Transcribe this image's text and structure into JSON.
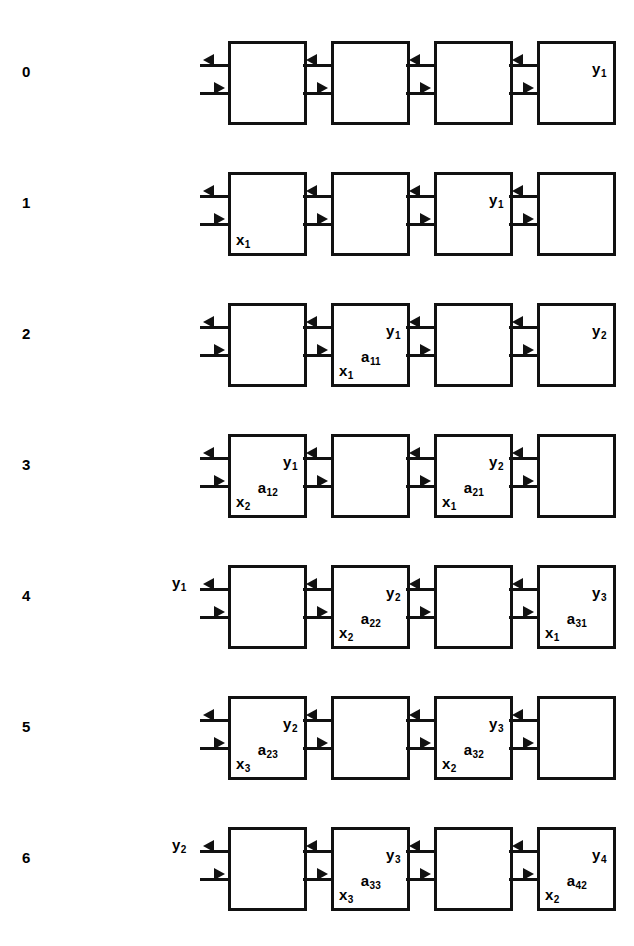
{
  "figure": {
    "type": "systolic-array-timestep-diagram",
    "num_steps": 7,
    "cells_per_row": 4,
    "geometry": {
      "row_pitch": 131,
      "first_row_top": 28,
      "cell_width": 79,
      "cell_height": 84,
      "cell_gap": 24,
      "first_cell_left": 228,
      "wire_stub_length": 28,
      "top_wire_y": 36,
      "bottom_wire_y": 64
    },
    "arrow_directions": {
      "top": "left",
      "bottom": "right"
    }
  },
  "rows": [
    {
      "step": "0",
      "external_left_label": "",
      "cells": [
        {
          "y": "",
          "a": "",
          "x": ""
        },
        {
          "y": "",
          "a": "",
          "x": ""
        },
        {
          "y": "",
          "a": "",
          "x": ""
        },
        {
          "y": "y1",
          "a": "",
          "x": ""
        }
      ]
    },
    {
      "step": "1",
      "external_left_label": "",
      "cells": [
        {
          "y": "",
          "a": "",
          "x": "x1"
        },
        {
          "y": "",
          "a": "",
          "x": ""
        },
        {
          "y": "y1",
          "a": "",
          "x": ""
        },
        {
          "y": "",
          "a": "",
          "x": ""
        }
      ]
    },
    {
      "step": "2",
      "external_left_label": "",
      "cells": [
        {
          "y": "",
          "a": "",
          "x": ""
        },
        {
          "y": "y1",
          "a": "a11",
          "x": "x1"
        },
        {
          "y": "",
          "a": "",
          "x": ""
        },
        {
          "y": "y2",
          "a": "",
          "x": ""
        }
      ]
    },
    {
      "step": "3",
      "external_left_label": "",
      "cells": [
        {
          "y": "y1",
          "a": "a12",
          "x": "x2"
        },
        {
          "y": "",
          "a": "",
          "x": ""
        },
        {
          "y": "y2",
          "a": "a21",
          "x": "x1"
        },
        {
          "y": "",
          "a": "",
          "x": ""
        }
      ]
    },
    {
      "step": "4",
      "external_left_label": "y1",
      "cells": [
        {
          "y": "",
          "a": "",
          "x": ""
        },
        {
          "y": "y2",
          "a": "a22",
          "x": "x2"
        },
        {
          "y": "",
          "a": "",
          "x": ""
        },
        {
          "y": "y3",
          "a": "a31",
          "x": "x1"
        }
      ]
    },
    {
      "step": "5",
      "external_left_label": "",
      "cells": [
        {
          "y": "y2",
          "a": "a23",
          "x": "x3"
        },
        {
          "y": "",
          "a": "",
          "x": ""
        },
        {
          "y": "y3",
          "a": "a32",
          "x": "x2"
        },
        {
          "y": "",
          "a": "",
          "x": ""
        }
      ]
    },
    {
      "step": "6",
      "external_left_label": "y2",
      "cells": [
        {
          "y": "",
          "a": "",
          "x": ""
        },
        {
          "y": "y3",
          "a": "a33",
          "x": "x3"
        },
        {
          "y": "",
          "a": "",
          "x": ""
        },
        {
          "y": "y4",
          "a": "a42",
          "x": "x2"
        }
      ]
    }
  ],
  "colors": {
    "ink": "#111111",
    "background": "#ffffff"
  }
}
